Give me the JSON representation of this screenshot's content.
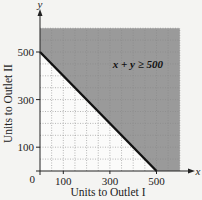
{
  "chart_data": {
    "type": "area",
    "title": "",
    "xlabel": "Units to Outlet I",
    "ylabel": "Units to Outlet II",
    "x_axis_symbol": "x",
    "y_axis_symbol": "y",
    "origin_label": "0",
    "x_ticks": [
      100,
      300,
      500
    ],
    "y_ticks": [
      100,
      300,
      500
    ],
    "x_tick_labels": [
      "100",
      "300",
      "500"
    ],
    "y_tick_labels": [
      "100",
      "300",
      "500"
    ],
    "xlim": [
      0,
      600
    ],
    "ylim": [
      0,
      600
    ],
    "grid": true,
    "grid_step": 50,
    "boundary_line": {
      "equation": "x + y = 500",
      "points": [
        [
          0,
          500
        ],
        [
          500,
          0
        ]
      ]
    },
    "shaded_region": {
      "inequality": "x + y ≥ 500",
      "description": "region above/right of the line, shaded gray"
    },
    "annotations": [
      {
        "text": "x + y ≥ 500",
        "x": 420,
        "y": 450
      }
    ],
    "legend": null
  },
  "colors": {
    "shade": "#9a9a9a",
    "line": "#111111",
    "grid": "#888888",
    "background": "#f4f4f2"
  }
}
